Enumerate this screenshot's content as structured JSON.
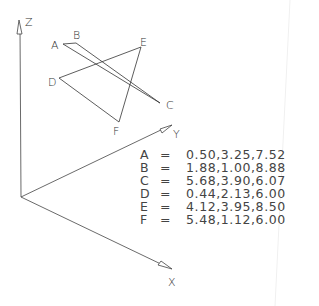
{
  "axes": {
    "z_label": "Z",
    "y_label": "Y",
    "x_label": "X"
  },
  "points": [
    {
      "name": "A",
      "coords": "0.50,3.25,7.52"
    },
    {
      "name": "B",
      "coords": "1.88,1.00,8.88"
    },
    {
      "name": "C",
      "coords": "5.68,3.90,6.07"
    },
    {
      "name": "D",
      "coords": "0.44,2.13,6.00"
    },
    {
      "name": "E",
      "coords": "4.12,3.95,8.50"
    },
    {
      "name": "F",
      "coords": "5.48,1.12,6.00"
    }
  ],
  "equals_sign": "=",
  "colors": {
    "line": "#333333",
    "text": "#444444",
    "background": "#ffffff"
  }
}
